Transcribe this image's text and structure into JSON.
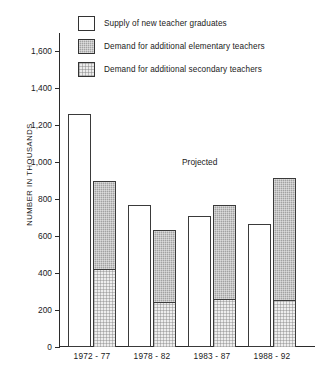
{
  "chart_data": {
    "type": "bar",
    "title": "",
    "subtitle": "",
    "xlabel": "",
    "ylabel": "NUMBER IN THOUSANDS",
    "ylim": [
      0,
      1700
    ],
    "yticks": [
      0,
      200,
      400,
      600,
      800,
      1000,
      1200,
      1400,
      1600
    ],
    "ytick_labels": [
      "0",
      "200",
      "400",
      "600",
      "800",
      "1,000",
      "1,200",
      "1,400",
      "1,600"
    ],
    "grid": false,
    "legend_position": "top-left",
    "categories": [
      "1972 - 77",
      "1978 - 82",
      "1983 - 87",
      "1988 - 92"
    ],
    "series": [
      {
        "name": "Supply of new teacher graduates",
        "swatch": "sw-supply",
        "color": "#ffffff",
        "values": [
          1260,
          770,
          710,
          665
        ]
      },
      {
        "name": "Demand for additional elementary teachers",
        "swatch": "sw-elementary",
        "color": "#a2a2a2",
        "values": [
          475,
          390,
          510,
          660
        ]
      },
      {
        "name": "Demand for additional secondary teachers",
        "swatch": "sw-secondary",
        "color": "#ececec",
        "values": [
          425,
          245,
          260,
          255
        ]
      }
    ],
    "demand_totals": [
      900,
      635,
      770,
      915
    ],
    "annotations": [
      {
        "text": "Projected",
        "x_category": "1983 - 87",
        "y_value": 1030
      }
    ]
  },
  "legend": {
    "items": [
      {
        "label": "Supply of new teacher graduates",
        "swatch": "sw-supply"
      },
      {
        "label": "Demand for additional elementary teachers",
        "swatch": "sw-elementary"
      },
      {
        "label": "Demand for additional secondary teachers",
        "swatch": "sw-secondary"
      }
    ]
  },
  "annotation": {
    "projected": "Projected"
  }
}
